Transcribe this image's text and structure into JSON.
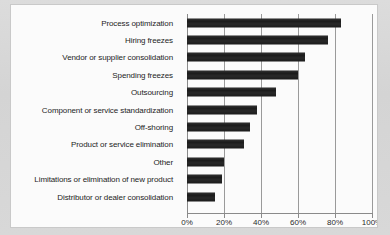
{
  "chart_panel": {
    "title": ""
  },
  "chart_data": {
    "type": "bar",
    "orientation": "horizontal",
    "title": "",
    "xlabel": "",
    "ylabel": "",
    "xlim": [
      0,
      100
    ],
    "grid": true,
    "legend": "none",
    "xtick_labels": [
      "0%",
      "20%",
      "40%",
      "60%",
      "80%",
      "100%"
    ],
    "xticks": [
      0,
      20,
      40,
      60,
      80,
      100
    ],
    "categories": [
      "Process optimization",
      "Hiring freezes",
      "Vendor or supplier consolidation",
      "Spending freezes",
      "Outsourcing",
      "Component or service standardization",
      "Off-shoring",
      "Product or service elimination",
      "Other",
      "Limitations or elimination of new product",
      "Distributor or dealer consolidation"
    ],
    "values": [
      83,
      76,
      64,
      60,
      48,
      38,
      34,
      31,
      20,
      19,
      15
    ],
    "value_labels": [
      "83%",
      "76%",
      "64%",
      "60%",
      "48%",
      "38%",
      "34%",
      "31%",
      "20%",
      "19%",
      "15%"
    ],
    "bar_color": "#1b1b1b",
    "grid_color": "#9a9a9a",
    "panel_color": "#fbfbfb",
    "background_color": "#d7d7d7"
  }
}
